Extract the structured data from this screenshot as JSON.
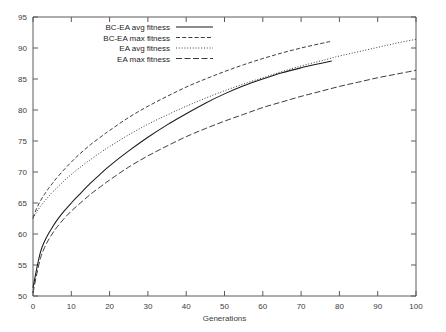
{
  "chart_data": {
    "type": "line",
    "title": "",
    "xlabel": "Generations",
    "ylabel": "",
    "xlim": [
      0,
      100
    ],
    "ylim": [
      50,
      95
    ],
    "grid": false,
    "legend_position": "top-left",
    "xticks": [
      0,
      10,
      20,
      30,
      40,
      50,
      60,
      70,
      80,
      90,
      100
    ],
    "yticks": [
      50,
      55,
      60,
      65,
      70,
      75,
      80,
      85,
      90,
      95
    ],
    "series": [
      {
        "name": "BC-EA avg fitness",
        "style": "solid",
        "x": [
          0,
          1,
          2,
          3,
          4,
          5,
          6,
          8,
          10,
          12,
          15,
          18,
          20,
          25,
          30,
          35,
          40,
          45,
          50,
          55,
          60,
          65,
          70,
          75,
          78
        ],
        "values": [
          51.3,
          54.5,
          57.2,
          58.8,
          60.0,
          61.0,
          62.0,
          63.6,
          65.0,
          66.3,
          68.2,
          69.9,
          71.0,
          73.4,
          75.6,
          77.6,
          79.4,
          81.1,
          82.6,
          83.9,
          85.0,
          86.0,
          86.8,
          87.5,
          87.9
        ]
      },
      {
        "name": "BC-EA max fitness",
        "style": "dashed",
        "x": [
          0,
          1,
          2,
          3,
          4,
          5,
          6,
          8,
          10,
          12,
          15,
          18,
          20,
          25,
          30,
          35,
          40,
          45,
          50,
          55,
          60,
          65,
          70,
          75,
          78
        ],
        "values": [
          62.6,
          64.2,
          65.4,
          66.4,
          67.3,
          68.1,
          68.9,
          70.3,
          71.6,
          72.8,
          74.4,
          75.8,
          76.7,
          78.8,
          80.6,
          82.2,
          83.7,
          85.0,
          86.2,
          87.3,
          88.3,
          89.2,
          90.0,
          90.7,
          91.1
        ]
      },
      {
        "name": "EA avg fitness",
        "style": "dotted-fine",
        "x": [
          0,
          1,
          2,
          3,
          4,
          5,
          6,
          8,
          10,
          12,
          15,
          18,
          20,
          25,
          30,
          35,
          40,
          45,
          50,
          55,
          60,
          65,
          70,
          75,
          80,
          85,
          90,
          95,
          100
        ],
        "values": [
          62.5,
          63.6,
          64.5,
          65.3,
          66.0,
          66.7,
          67.3,
          68.5,
          69.6,
          70.6,
          72.0,
          73.3,
          74.1,
          76.0,
          77.7,
          79.2,
          80.6,
          81.9,
          83.1,
          84.2,
          85.2,
          86.2,
          87.1,
          87.9,
          88.7,
          89.4,
          90.1,
          90.8,
          91.4
        ]
      },
      {
        "name": "EA max fitness",
        "style": "long-dashed",
        "x": [
          0,
          1,
          2,
          3,
          4,
          5,
          6,
          8,
          10,
          12,
          15,
          18,
          20,
          25,
          30,
          35,
          40,
          45,
          50,
          55,
          60,
          65,
          70,
          75,
          80,
          85,
          90,
          95,
          100
        ],
        "values": [
          50.5,
          53.6,
          56.2,
          57.8,
          59.0,
          60.0,
          60.9,
          62.4,
          63.7,
          64.8,
          66.4,
          67.8,
          68.7,
          70.8,
          72.6,
          74.2,
          75.7,
          77.0,
          78.2,
          79.3,
          80.4,
          81.3,
          82.2,
          83.0,
          83.8,
          84.5,
          85.2,
          85.8,
          86.4
        ]
      }
    ]
  },
  "legend": {
    "entries": [
      {
        "label": "BC-EA avg fitness",
        "style": "solid"
      },
      {
        "label": "BC-EA max fitness",
        "style": "dashed"
      },
      {
        "label": "EA avg fitness",
        "style": "dotted-fine"
      },
      {
        "label": "EA max fitness",
        "style": "long-dashed"
      }
    ]
  },
  "axis": {
    "x_label": "Generations",
    "x_tick_labels": [
      "0",
      "10",
      "20",
      "30",
      "40",
      "50",
      "60",
      "70",
      "80",
      "90",
      "100"
    ],
    "y_tick_labels": [
      "50",
      "55",
      "60",
      "65",
      "70",
      "75",
      "80",
      "85",
      "90",
      "95"
    ]
  },
  "colors": {
    "line": "#1a1a1a",
    "axis": "#5a5a5a",
    "text": "#3c3c3c",
    "background": "#ffffff"
  }
}
